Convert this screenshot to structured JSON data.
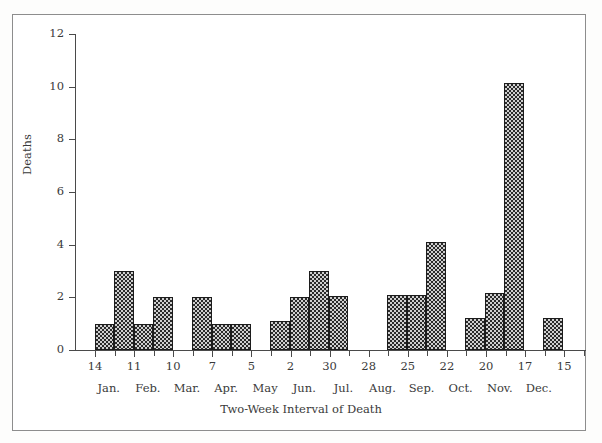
{
  "chart_data": {
    "type": "bar",
    "title": "",
    "xlabel": "Two-Week Interval of Death",
    "ylabel": "Deaths",
    "ylim": [
      0,
      12
    ],
    "yticks": [
      0,
      2,
      4,
      6,
      8,
      10,
      12
    ],
    "grid": false,
    "legend": null,
    "xtick_labels": [
      "14",
      "11",
      "10",
      "7",
      "5",
      "2",
      "30",
      "28",
      "25",
      "22",
      "20",
      "17",
      "15"
    ],
    "month_labels": [
      "Jan.",
      "Feb.",
      "Mar.",
      "Apr.",
      "May",
      "Jun.",
      "Jul.",
      "Aug.",
      "Sep.",
      "Oct.",
      "Nov.",
      "Dec."
    ],
    "categories": [
      "Jan 14",
      "Jan 28",
      "Feb 11",
      "Feb 25",
      "Mar 10",
      "Mar 24",
      "Apr 7",
      "Apr 21",
      "May 5",
      "May 19",
      "Jun 2",
      "Jun 16",
      "Jun 30",
      "Jul 14",
      "Jul 28",
      "Aug 11",
      "Aug 25",
      "Sep 8",
      "Sep 22",
      "Oct 6",
      "Oct 20",
      "Nov 3",
      "Nov 17",
      "Dec 1",
      "Dec 15",
      "Dec 29"
    ],
    "values": [
      0,
      1,
      3,
      1,
      2,
      0,
      2,
      1,
      1,
      0,
      1.1,
      2,
      3,
      2.05,
      0,
      0,
      0,
      2.1,
      2.1,
      4.1,
      0,
      1.2,
      2.15,
      10.15,
      0,
      1.2
    ],
    "bars": [
      {
        "label": "Jan 28",
        "value": 1,
        "x": 95,
        "width": 19
      },
      {
        "label": "Feb 11",
        "value": 3,
        "x": 114,
        "width": 20
      },
      {
        "label": "Feb 25",
        "value": 1,
        "x": 134,
        "width": 19
      },
      {
        "label": "Mar 10",
        "value": 2,
        "x": 153,
        "width": 20
      },
      {
        "label": "Apr 7",
        "value": 2,
        "x": 192,
        "width": 20
      },
      {
        "label": "Apr 21",
        "value": 1,
        "x": 212,
        "width": 19
      },
      {
        "label": "May 5",
        "value": 1,
        "x": 231,
        "width": 20
      },
      {
        "label": "Jun 2",
        "value": 1.1,
        "x": 270,
        "width": 20
      },
      {
        "label": "Jun 16",
        "value": 2,
        "x": 290,
        "width": 19
      },
      {
        "label": "Jun 30",
        "value": 3,
        "x": 309,
        "width": 20
      },
      {
        "label": "Jul 14",
        "value": 2.05,
        "x": 329,
        "width": 19
      },
      {
        "label": "Sep 8",
        "value": 2.1,
        "x": 387,
        "width": 20
      },
      {
        "label": "Sep 22",
        "value": 2.1,
        "x": 407,
        "width": 19
      },
      {
        "label": "Oct 6",
        "value": 4.1,
        "x": 426,
        "width": 20
      },
      {
        "label": "Nov 3",
        "value": 1.2,
        "x": 465,
        "width": 20
      },
      {
        "label": "Nov 17",
        "value": 2.15,
        "x": 485,
        "width": 19
      },
      {
        "label": "Dec 1",
        "value": 10.15,
        "x": 504,
        "width": 20
      },
      {
        "label": "Dec 29",
        "value": 1.2,
        "x": 543,
        "width": 20
      }
    ]
  },
  "axis": {
    "y_title": "Deaths",
    "x_title": "Two-Week Interval of Death"
  }
}
